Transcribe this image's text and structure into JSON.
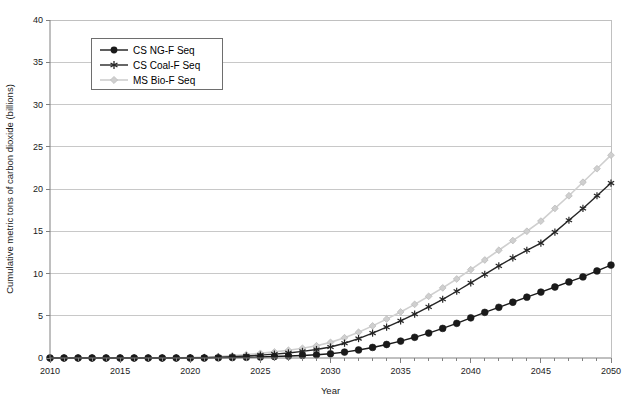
{
  "chart_data": {
    "type": "line",
    "title": "",
    "xlabel": "Year",
    "ylabel": "Cumulative metric tons of carbon dioxide (billions)",
    "xlim": [
      2010,
      2050
    ],
    "ylim": [
      0,
      40
    ],
    "xticks": [
      2010,
      2015,
      2020,
      2025,
      2030,
      2035,
      2040,
      2045,
      2050
    ],
    "xtick_labels": [
      "2010",
      "2015",
      "2020",
      "2025",
      "2030",
      "2035",
      "2040",
      "2045",
      "2050"
    ],
    "yticks": [
      0,
      5,
      10,
      15,
      20,
      25,
      30,
      35,
      40
    ],
    "ytick_labels": [
      "0",
      "5",
      "10",
      "15",
      "20",
      "25",
      "30",
      "35",
      "40"
    ],
    "x_minor_tick_step": 1,
    "grid": "horizontal",
    "legend_position": "upper-left-inset",
    "x": [
      2010,
      2011,
      2012,
      2013,
      2014,
      2015,
      2016,
      2017,
      2018,
      2019,
      2020,
      2021,
      2022,
      2023,
      2024,
      2025,
      2026,
      2027,
      2028,
      2029,
      2030,
      2031,
      2032,
      2033,
      2034,
      2035,
      2036,
      2037,
      2038,
      2039,
      2040,
      2041,
      2042,
      2043,
      2044,
      2045,
      2046,
      2047,
      2048,
      2049,
      2050
    ],
    "series": [
      {
        "name": "CS NG-F Seq",
        "marker": "filled-circle",
        "color": "#1a1a1a",
        "values": [
          0,
          0,
          0,
          0,
          0,
          0,
          0,
          0,
          0,
          0,
          0,
          0,
          0.02,
          0.05,
          0.08,
          0.12,
          0.17,
          0.23,
          0.3,
          0.38,
          0.5,
          0.7,
          0.95,
          1.25,
          1.6,
          2.0,
          2.45,
          2.95,
          3.5,
          4.1,
          4.75,
          5.4,
          6.0,
          6.6,
          7.2,
          7.8,
          8.4,
          9.0,
          9.6,
          10.3,
          11.0
        ]
      },
      {
        "name": "CS Coal-F Seq",
        "marker": "star",
        "color": "#262626",
        "values": [
          0,
          0,
          0,
          0,
          0,
          0,
          0,
          0,
          0,
          0,
          0.02,
          0.05,
          0.1,
          0.16,
          0.24,
          0.34,
          0.46,
          0.6,
          0.78,
          1.0,
          1.3,
          1.75,
          2.3,
          2.95,
          3.65,
          4.4,
          5.2,
          6.05,
          6.95,
          7.9,
          8.9,
          9.9,
          10.9,
          11.85,
          12.75,
          13.6,
          14.9,
          16.3,
          17.7,
          19.2,
          20.7
        ]
      },
      {
        "name": "MS Bio-F Seq",
        "marker": "diamond",
        "color": "#cfcfcf",
        "values": [
          0,
          0,
          0,
          0,
          0,
          0,
          0,
          0,
          0,
          0.02,
          0.05,
          0.1,
          0.18,
          0.28,
          0.4,
          0.55,
          0.72,
          0.92,
          1.15,
          1.45,
          1.85,
          2.4,
          3.05,
          3.8,
          4.6,
          5.45,
          6.35,
          7.3,
          8.3,
          9.35,
          10.45,
          11.6,
          12.75,
          13.9,
          15.0,
          16.2,
          17.7,
          19.2,
          20.8,
          22.4,
          24.0
        ]
      }
    ]
  },
  "legend": {
    "entries": [
      {
        "label": "CS NG-F Seq"
      },
      {
        "label": "CS Coal-F Seq"
      },
      {
        "label": "MS Bio-F Seq"
      }
    ]
  }
}
